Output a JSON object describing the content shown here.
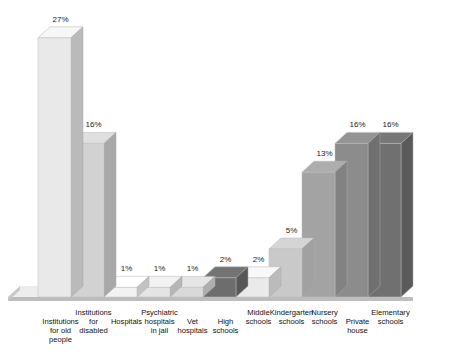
{
  "chart_data": {
    "type": "bar",
    "title": "",
    "subtitle": "",
    "xlabel": "",
    "ylabel": "",
    "ylim": [
      0,
      27
    ],
    "grid": false,
    "legend": false,
    "style": "3d-blocks-grayscale",
    "categories": [
      "Institutions\nfor old\npeople",
      "Institutions\nfor\ndisabled",
      "Hospitals",
      "Psychiatric\nhospitals\nin jail",
      "Vet\nhospitals",
      "High\nschools",
      "Middle\nschools",
      "Kindergarten\nschools",
      "Nursery\nschools",
      "Private\nhouse",
      "Elementary\nschools"
    ],
    "values": [
      27,
      16,
      1,
      1,
      1,
      2,
      2,
      5,
      13,
      16,
      16
    ],
    "value_labels": [
      "27%",
      "16%",
      "1%",
      "1%",
      "1%",
      "2%",
      "2%",
      "5%",
      "13%",
      "16%",
      "16%"
    ],
    "bar_colors": [
      "#e9e9e9",
      "#d2d2d2",
      "#f2f2f2",
      "#e4e4e4",
      "#d9d9d9",
      "#6d6d6d",
      "#eaeaea",
      "#c9c9c9",
      "#a3a3a3",
      "#8c8c8c",
      "#707070"
    ]
  },
  "geometry": {
    "baseline_y": 297,
    "px_per_percent": 9.6,
    "bar_width": 33,
    "depth_x": 12,
    "depth_y": 11,
    "first_bar_x": 38,
    "floor_color": "#ededed",
    "floor_edge_color": "#bdbdbd",
    "top_face_tint": "#f7f7f7",
    "side_face_shade": "#9d9d9d"
  },
  "label_rows": {
    "row_offsets": [
      0,
      9.2,
      18.4
    ]
  }
}
